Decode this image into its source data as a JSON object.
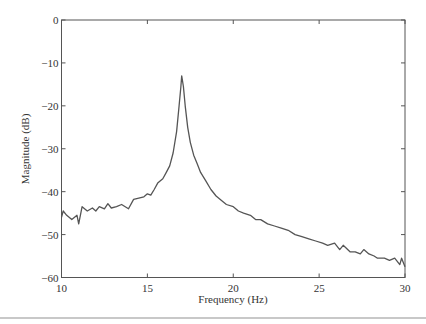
{
  "chart_data": {
    "type": "line",
    "title": "",
    "xlabel": "Frequency (Hz)",
    "ylabel": "Magnitude (dB)",
    "xlim": [
      10,
      30
    ],
    "ylim": [
      -60,
      0
    ],
    "xticks": [
      10,
      15,
      20,
      25,
      30
    ],
    "yticks": [
      0,
      -10,
      -20,
      -30,
      -40,
      -50,
      -60
    ],
    "xtick_labels": [
      "10",
      "15",
      "20",
      "25",
      "30"
    ],
    "ytick_labels": [
      "0",
      "−10",
      "−20",
      "−30",
      "−40",
      "−50",
      "−60"
    ],
    "grid": false,
    "legend": null,
    "series": [
      {
        "name": "magnitude",
        "color": "#555555",
        "x": [
          10.0,
          10.1,
          10.3,
          10.6,
          10.9,
          11.0,
          11.2,
          11.5,
          11.8,
          12.0,
          12.2,
          12.5,
          12.7,
          12.9,
          13.2,
          13.5,
          13.9,
          14.2,
          14.5,
          14.8,
          15.0,
          15.2,
          15.4,
          15.6,
          15.9,
          16.1,
          16.3,
          16.5,
          16.7,
          16.85,
          16.95,
          17.0,
          17.1,
          17.2,
          17.35,
          17.5,
          17.7,
          17.9,
          18.1,
          18.4,
          18.7,
          19.0,
          19.3,
          19.6,
          20.0,
          20.3,
          20.6,
          21.0,
          21.3,
          21.6,
          22.0,
          22.4,
          22.8,
          23.2,
          23.6,
          24.0,
          24.4,
          24.8,
          25.2,
          25.5,
          25.9,
          26.2,
          26.4,
          26.8,
          27.1,
          27.4,
          27.6,
          27.9,
          28.2,
          28.4,
          28.8,
          29.1,
          29.4,
          29.7,
          29.8,
          30.0
        ],
        "y": [
          -46,
          -44.5,
          -45.5,
          -46.5,
          -45.5,
          -47.5,
          -43.5,
          -44.5,
          -43.8,
          -44.5,
          -43.5,
          -44,
          -42.8,
          -43.8,
          -43.5,
          -43,
          -44,
          -41.8,
          -41.5,
          -41.2,
          -40.5,
          -40.8,
          -39.5,
          -38,
          -37,
          -35.5,
          -34,
          -31,
          -26,
          -20,
          -15.5,
          -13,
          -15.5,
          -20,
          -25,
          -28.5,
          -31.5,
          -33.5,
          -35.5,
          -37.5,
          -39.5,
          -41,
          -42,
          -43,
          -43.5,
          -44.5,
          -45,
          -45.5,
          -46.5,
          -46.5,
          -47.5,
          -48,
          -48.5,
          -49,
          -50,
          -50.5,
          -51,
          -51.5,
          -52,
          -52.5,
          -52,
          -53.5,
          -52.5,
          -54,
          -54,
          -54.5,
          -53.5,
          -54.5,
          -55,
          -55.5,
          -55.5,
          -56,
          -55.5,
          -57,
          -55.5,
          -57.5
        ]
      }
    ]
  }
}
